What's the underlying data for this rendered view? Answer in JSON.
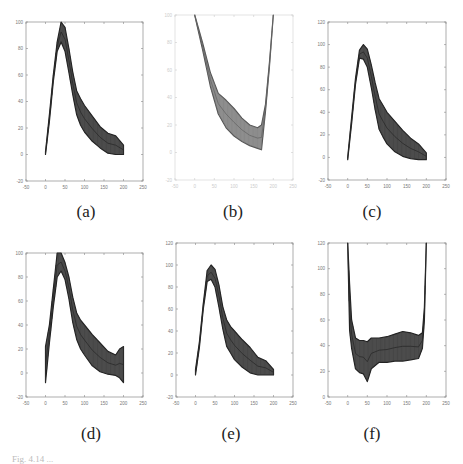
{
  "figure": {
    "caption": "Fig. 4.14 ..."
  },
  "labels": [
    "(a)",
    "(b)",
    "(c)",
    "(d)",
    "(e)",
    "(f)"
  ],
  "chart_data": [
    {
      "id": "a",
      "type": "area",
      "title": "(a)",
      "xlabel": "",
      "ylabel": "",
      "xlim": [
        -50,
        250
      ],
      "ylim": [
        -20,
        100
      ],
      "xticks": [
        -50,
        0,
        50,
        100,
        150,
        200,
        250
      ],
      "yticks": [
        -20,
        0,
        20,
        40,
        60,
        80,
        100
      ],
      "grid": false,
      "x": [
        0,
        10,
        20,
        30,
        40,
        50,
        60,
        70,
        80,
        90,
        100,
        120,
        140,
        160,
        180,
        200
      ],
      "series": [
        {
          "name": "upper",
          "values": [
            2,
            30,
            60,
            85,
            100,
            96,
            80,
            62,
            48,
            42,
            37,
            29,
            21,
            16,
            14,
            7
          ]
        },
        {
          "name": "lower",
          "values": [
            0,
            25,
            55,
            78,
            85,
            78,
            62,
            45,
            30,
            22,
            17,
            10,
            5,
            1,
            0,
            0
          ]
        }
      ]
    },
    {
      "id": "b",
      "type": "area",
      "title": "(b)",
      "xlabel": "",
      "ylabel": "",
      "xlim": [
        -50,
        250
      ],
      "ylim": [
        -20,
        100
      ],
      "xticks": [
        -50,
        0,
        50,
        100,
        150,
        200,
        250
      ],
      "yticks": [
        -20,
        0,
        20,
        40,
        60,
        80,
        100
      ],
      "grid": false,
      "x": [
        0,
        20,
        40,
        60,
        80,
        100,
        120,
        140,
        160,
        170,
        180,
        190,
        200
      ],
      "series": [
        {
          "name": "upper",
          "values": [
            100,
            80,
            58,
            43,
            38,
            32,
            25,
            20,
            18,
            20,
            35,
            65,
            100
          ]
        },
        {
          "name": "lower",
          "values": [
            100,
            75,
            48,
            28,
            18,
            12,
            8,
            5,
            3,
            2,
            30,
            62,
            100
          ]
        }
      ]
    },
    {
      "id": "c",
      "type": "area",
      "title": "(c)",
      "xlabel": "",
      "ylabel": "",
      "xlim": [
        -50,
        250
      ],
      "ylim": [
        -20,
        120
      ],
      "xticks": [
        -50,
        0,
        50,
        100,
        150,
        200,
        250
      ],
      "yticks": [
        -20,
        0,
        20,
        40,
        60,
        80,
        100,
        120
      ],
      "grid": false,
      "x": [
        0,
        10,
        20,
        30,
        40,
        50,
        60,
        70,
        80,
        90,
        100,
        120,
        140,
        160,
        180,
        200
      ],
      "series": [
        {
          "name": "upper",
          "values": [
            0,
            35,
            70,
            95,
            100,
            96,
            82,
            66,
            52,
            46,
            40,
            32,
            24,
            17,
            12,
            4
          ]
        },
        {
          "name": "lower",
          "values": [
            -2,
            30,
            65,
            88,
            87,
            80,
            62,
            42,
            25,
            18,
            12,
            5,
            1,
            -1,
            -2,
            -2
          ]
        }
      ]
    },
    {
      "id": "d",
      "type": "area",
      "title": "(d)",
      "xlabel": "",
      "ylabel": "",
      "xlim": [
        -50,
        250
      ],
      "ylim": [
        -20,
        100
      ],
      "xticks": [
        -50,
        0,
        50,
        100,
        150,
        200,
        250
      ],
      "yticks": [
        -20,
        0,
        20,
        40,
        60,
        80,
        100
      ],
      "grid": false,
      "x": [
        0,
        10,
        20,
        30,
        40,
        50,
        60,
        70,
        80,
        90,
        100,
        120,
        140,
        160,
        180,
        190,
        200
      ],
      "series": [
        {
          "name": "upper",
          "values": [
            22,
            40,
            70,
            100,
            100,
            92,
            80,
            63,
            50,
            44,
            40,
            32,
            25,
            18,
            15,
            20,
            22
          ]
        },
        {
          "name": "lower",
          "values": [
            -8,
            25,
            55,
            80,
            85,
            78,
            62,
            42,
            28,
            20,
            15,
            6,
            1,
            -1,
            -2,
            -4,
            -8
          ]
        }
      ]
    },
    {
      "id": "e",
      "type": "area",
      "title": "(e)",
      "xlabel": "",
      "ylabel": "",
      "xlim": [
        -50,
        250
      ],
      "ylim": [
        -20,
        120
      ],
      "xticks": [
        -50,
        0,
        50,
        100,
        150,
        200,
        250
      ],
      "yticks": [
        -20,
        0,
        20,
        40,
        60,
        80,
        100,
        120
      ],
      "grid": false,
      "x": [
        0,
        10,
        20,
        30,
        40,
        50,
        60,
        70,
        80,
        90,
        100,
        120,
        140,
        160,
        180,
        200
      ],
      "series": [
        {
          "name": "upper",
          "values": [
            5,
            30,
            65,
            95,
            100,
            96,
            82,
            62,
            50,
            44,
            40,
            32,
            25,
            16,
            13,
            5
          ]
        },
        {
          "name": "lower",
          "values": [
            0,
            25,
            60,
            85,
            87,
            80,
            62,
            42,
            26,
            20,
            14,
            7,
            2,
            0,
            0,
            0
          ]
        }
      ]
    },
    {
      "id": "f",
      "type": "area",
      "title": "(f)",
      "xlabel": "",
      "ylabel": "",
      "xlim": [
        -50,
        250
      ],
      "ylim": [
        0,
        120
      ],
      "xticks": [
        -50,
        0,
        50,
        100,
        150,
        200,
        250
      ],
      "yticks": [
        0,
        20,
        40,
        60,
        80,
        100,
        120
      ],
      "grid": false,
      "x": [
        0,
        5,
        10,
        20,
        30,
        40,
        50,
        60,
        80,
        100,
        120,
        140,
        160,
        180,
        190,
        195,
        200
      ],
      "series": [
        {
          "name": "upper",
          "values": [
            120,
            88,
            60,
            46,
            44,
            44,
            43,
            46,
            46,
            47,
            49,
            51,
            50,
            48,
            50,
            70,
            120
          ]
        },
        {
          "name": "lower",
          "values": [
            120,
            52,
            38,
            22,
            19,
            18,
            12,
            22,
            27,
            27,
            28,
            28,
            29,
            30,
            38,
            60,
            120
          ]
        }
      ]
    }
  ]
}
